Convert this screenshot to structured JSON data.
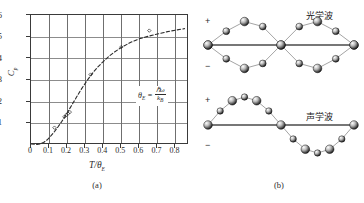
{
  "figure": {
    "panel_a": {
      "caption": "(a)",
      "ylabel": "C",
      "ylabel_sub": "p",
      "xlabel_num": "T",
      "xlabel_den": "θ",
      "xlabel_den_sub": "E",
      "formula": {
        "lhs": "θ",
        "lhs_sub": "E",
        "equals": "=",
        "numerator": "ℏω",
        "denominator": "k",
        "denominator_sub": "B"
      }
    },
    "panel_b": {
      "caption": "(b)",
      "optical_label": "光学波",
      "acoustic_label": "声学波",
      "plus_sign": "+",
      "minus_sign": "−"
    }
  },
  "chart_data": {
    "type": "line",
    "title": "",
    "xlabel": "T/θE",
    "ylabel": "Cp",
    "xlim": [
      0,
      0.875
    ],
    "ylim": [
      0,
      6
    ],
    "xticks": [
      "0",
      "0.1",
      "0.2",
      "0.3",
      "0.4",
      "0.5",
      "0.6",
      "0.7",
      "0.8"
    ],
    "xtick_values": [
      0,
      0.1,
      0.2,
      0.3,
      0.4,
      0.5,
      0.6,
      0.7,
      0.8
    ],
    "yticks": [
      "1",
      "2",
      "3",
      "4",
      "5",
      "6"
    ],
    "ytick_values": [
      1,
      2,
      3,
      4,
      5,
      6
    ],
    "grid": true,
    "legend": "none",
    "series": [
      {
        "name": "Einstein model curve",
        "style": "dashed",
        "x": [
          0.0,
          0.03,
          0.05,
          0.07,
          0.09,
          0.11,
          0.13,
          0.15,
          0.17,
          0.19,
          0.21,
          0.23,
          0.25,
          0.27,
          0.29,
          0.31,
          0.33,
          0.35,
          0.37,
          0.4,
          0.43,
          0.46,
          0.5,
          0.55,
          0.6,
          0.65,
          0.7,
          0.75,
          0.8,
          0.85
        ],
        "y": [
          0.0,
          0.02,
          0.05,
          0.12,
          0.24,
          0.42,
          0.62,
          0.84,
          1.08,
          1.34,
          1.62,
          1.9,
          2.18,
          2.46,
          2.72,
          2.97,
          3.2,
          3.41,
          3.6,
          3.85,
          4.08,
          4.28,
          4.5,
          4.73,
          4.9,
          5.02,
          5.12,
          5.22,
          5.3,
          5.37
        ]
      },
      {
        "name": "experimental points (diamond)",
        "style": "markers",
        "x": [
          0.13,
          0.185,
          0.195,
          0.205,
          0.215,
          0.33,
          0.5,
          0.655
        ],
        "y": [
          0.8,
          1.3,
          1.38,
          1.45,
          1.52,
          3.25,
          4.52,
          5.28
        ]
      }
    ]
  },
  "lattice": {
    "optical": {
      "description": "optical branch lattice wave: adjacent atoms vibrate out of phase, two chains cross",
      "chain_a_atoms": 9,
      "chain_b_atoms": 9
    },
    "acoustic": {
      "description": "acoustic branch lattice wave: adjacent atoms vibrate in phase along one sine wave",
      "atoms": 13
    }
  }
}
